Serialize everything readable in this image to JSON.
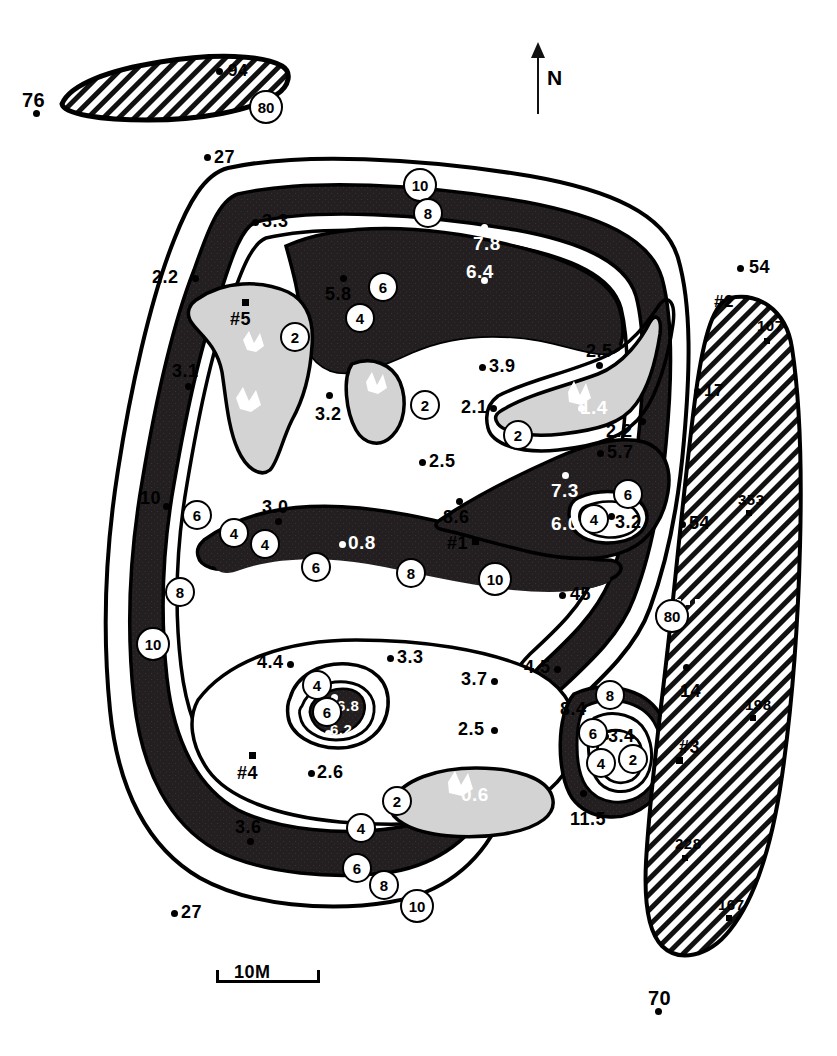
{
  "figure": {
    "type": "contour-map",
    "north_label": "N",
    "scale_label": "10M",
    "background": "#ffffff",
    "ink": "#000000",
    "fill_dark": "#231f20",
    "fill_gray": "#d3d3d3"
  },
  "legend_note": {
    "contour_interval_labels": [
      "2",
      "4",
      "6",
      "8",
      "10",
      "80"
    ]
  },
  "contour_tags": [
    {
      "id": "tag-top-10",
      "label": "10",
      "x": 403,
      "y": 168
    },
    {
      "id": "tag-top-8",
      "label": "8",
      "x": 413,
      "y": 198
    },
    {
      "id": "tag-upper-6",
      "label": "6",
      "x": 368,
      "y": 272
    },
    {
      "id": "tag-upper-4",
      "label": "4",
      "x": 345,
      "y": 303
    },
    {
      "id": "tag-left-2",
      "label": "2",
      "x": 280,
      "y": 322
    },
    {
      "id": "tag-mid-2a",
      "label": "2",
      "x": 410,
      "y": 390
    },
    {
      "id": "tag-mid-2b",
      "label": "2",
      "x": 503,
      "y": 420
    },
    {
      "id": "tag-left-6",
      "label": "6",
      "x": 182,
      "y": 500
    },
    {
      "id": "tag-left-4",
      "label": "4",
      "x": 219,
      "y": 518
    },
    {
      "id": "tag-left-8",
      "label": "8",
      "x": 165,
      "y": 577
    },
    {
      "id": "tag-left-10",
      "label": "10",
      "x": 136,
      "y": 627
    },
    {
      "id": "tag-center-4",
      "label": "4",
      "x": 250,
      "y": 529
    },
    {
      "id": "tag-center-6",
      "label": "6",
      "x": 301,
      "y": 552
    },
    {
      "id": "tag-center-8",
      "label": "8",
      "x": 396,
      "y": 558
    },
    {
      "id": "tag-center-10",
      "label": "10",
      "x": 478,
      "y": 562
    },
    {
      "id": "tag-right-6",
      "label": "6",
      "x": 613,
      "y": 479
    },
    {
      "id": "tag-right-4",
      "label": "4",
      "x": 579,
      "y": 504
    },
    {
      "id": "tag-right-80",
      "label": "80",
      "x": 655,
      "y": 599
    },
    {
      "id": "tag-low-4",
      "label": "4",
      "x": 302,
      "y": 670
    },
    {
      "id": "tag-low-6",
      "label": "6",
      "x": 312,
      "y": 697
    },
    {
      "id": "tag-low-2",
      "label": "2",
      "x": 382,
      "y": 786
    },
    {
      "id": "tag-bottom-4",
      "label": "4",
      "x": 346,
      "y": 813
    },
    {
      "id": "tag-bottom-6",
      "label": "6",
      "x": 342,
      "y": 853
    },
    {
      "id": "tag-bottom-8",
      "label": "8",
      "x": 369,
      "y": 870
    },
    {
      "id": "tag-bottom-10",
      "label": "10",
      "x": 400,
      "y": 889
    },
    {
      "id": "tag-se-8",
      "label": "8",
      "x": 595,
      "y": 680
    },
    {
      "id": "tag-se-6",
      "label": "6",
      "x": 578,
      "y": 718
    },
    {
      "id": "tag-se-4",
      "label": "4",
      "x": 586,
      "y": 748
    },
    {
      "id": "tag-se-2",
      "label": "2",
      "x": 618,
      "y": 744
    },
    {
      "id": "tag-inset-80",
      "label": "80",
      "x": 249,
      "y": 90
    }
  ],
  "stations": [
    {
      "id": "st-76",
      "label": "76",
      "lx": 22,
      "ly": 90,
      "dx": 33,
      "dy": 110,
      "size": "s20",
      "color": "black"
    },
    {
      "id": "st-94",
      "label": "94",
      "lx": 228,
      "ly": 62,
      "dx": 216,
      "dy": 68,
      "size": "s17",
      "color": "black"
    },
    {
      "id": "st-27a",
      "label": "27",
      "lx": 214,
      "ly": 148,
      "dx": 204,
      "dy": 154,
      "size": "s18",
      "color": "black"
    },
    {
      "id": "st-3p3",
      "label": "3.3",
      "lx": 262,
      "ly": 212,
      "dx": 252,
      "dy": 219,
      "size": "s18",
      "color": "black"
    },
    {
      "id": "st-2p2a",
      "label": "2.2",
      "lx": 152,
      "ly": 268,
      "dx": 192,
      "dy": 275,
      "size": "s18",
      "color": "black"
    },
    {
      "id": "st-5p5",
      "label": "#5",
      "lx": 230,
      "ly": 310,
      "dx": 242,
      "dy": 299,
      "size": "s18",
      "color": "black",
      "marker": "square"
    },
    {
      "id": "st-3p1",
      "label": "3.1",
      "lx": 172,
      "ly": 362,
      "dx": 185,
      "dy": 383,
      "size": "s18",
      "color": "black"
    },
    {
      "id": "st-3p2a",
      "label": "3.2",
      "lx": 315,
      "ly": 405,
      "dx": 326,
      "dy": 392,
      "size": "s18",
      "color": "black"
    },
    {
      "id": "st-5p8",
      "label": "5.8",
      "lx": 325,
      "ly": 285,
      "dx": 340,
      "dy": 275,
      "size": "s18",
      "color": "black"
    },
    {
      "id": "st-7p8",
      "label": "7.8",
      "lx": 473,
      "ly": 234,
      "dx": 481,
      "dy": 224,
      "size": "s19",
      "color": "white"
    },
    {
      "id": "st-6p4",
      "label": "6.4",
      "lx": 466,
      "ly": 262,
      "dx": 481,
      "dy": 277,
      "size": "s19",
      "color": "white"
    },
    {
      "id": "st-3p9",
      "label": "3.9",
      "lx": 489,
      "ly": 357,
      "dx": 479,
      "dy": 364,
      "size": "s18",
      "color": "black"
    },
    {
      "id": "st-2p5a",
      "label": "2.5",
      "lx": 586,
      "ly": 342,
      "dx": 596,
      "dy": 362,
      "size": "s18",
      "color": "black"
    },
    {
      "id": "st-2p1",
      "label": "2.1",
      "lx": 461,
      "ly": 398,
      "dx": 490,
      "dy": 405,
      "size": "s18",
      "color": "black"
    },
    {
      "id": "st-1p4",
      "label": "1.4",
      "lx": 580,
      "ly": 398,
      "dx": 578,
      "dy": 405,
      "size": "s19",
      "color": "white"
    },
    {
      "id": "st-2p2b",
      "label": "2.2",
      "lx": 606,
      "ly": 422,
      "dx": 639,
      "dy": 418,
      "size": "s18",
      "color": "black"
    },
    {
      "id": "st-2p5b",
      "label": "2.5",
      "lx": 429,
      "ly": 452,
      "dx": 419,
      "dy": 459,
      "size": "s18",
      "color": "black"
    },
    {
      "id": "st-5p7",
      "label": "5.7",
      "lx": 607,
      "ly": 443,
      "dx": 597,
      "dy": 450,
      "size": "s18",
      "color": "black"
    },
    {
      "id": "st-3p0",
      "label": "3.0",
      "lx": 262,
      "ly": 498,
      "dx": 275,
      "dy": 518,
      "size": "s18",
      "color": "black"
    },
    {
      "id": "st-0p8",
      "label": "0.8",
      "lx": 348,
      "ly": 533,
      "dx": 339,
      "dy": 541,
      "size": "s19",
      "color": "white"
    },
    {
      "id": "st-8p6",
      "label": "8.6",
      "lx": 443,
      "ly": 508,
      "dx": 456,
      "dy": 498,
      "size": "s18",
      "color": "black"
    },
    {
      "id": "st-1sq",
      "label": "#1",
      "lx": 447,
      "ly": 534,
      "dx": 472,
      "dy": 538,
      "size": "s18",
      "color": "black",
      "marker": "square"
    },
    {
      "id": "st-7p3",
      "label": "7.3",
      "lx": 551,
      "ly": 481,
      "dx": 562,
      "dy": 472,
      "size": "s19",
      "color": "white"
    },
    {
      "id": "st-6p0",
      "label": "6.0",
      "lx": 551,
      "ly": 514,
      "dx": 578,
      "dy": 521,
      "size": "s19",
      "color": "white"
    },
    {
      "id": "st-3p2b",
      "label": "3.2",
      "lx": 615,
      "ly": 513,
      "dx": 608,
      "dy": 513,
      "size": "s18",
      "color": "black"
    },
    {
      "id": "st-54a",
      "label": "54",
      "lx": 749,
      "ly": 258,
      "dx": 737,
      "dy": 265,
      "size": "s18",
      "color": "black"
    },
    {
      "id": "st-2sq",
      "label": "#2",
      "lx": 714,
      "ly": 293,
      "dx": 0,
      "dy": 0,
      "size": "s17",
      "color": "black",
      "marker": "none"
    },
    {
      "id": "st-107",
      "label": "107",
      "lx": 757,
      "ly": 318,
      "dx": 764,
      "dy": 338,
      "size": "s15",
      "color": "black",
      "marker": "smallsq"
    },
    {
      "id": "st-17",
      "label": "17",
      "lx": 704,
      "ly": 382,
      "dx": 694,
      "dy": 388,
      "size": "s17",
      "color": "black"
    },
    {
      "id": "st-353",
      "label": "353",
      "lx": 738,
      "ly": 492,
      "dx": 746,
      "dy": 510,
      "size": "s15",
      "color": "black",
      "marker": "smallsq"
    },
    {
      "id": "st-54b",
      "label": "54",
      "lx": 689,
      "ly": 514,
      "dx": 679,
      "dy": 521,
      "size": "s18",
      "color": "black"
    },
    {
      "id": "st-45",
      "label": "45",
      "lx": 570,
      "ly": 585,
      "dx": 559,
      "dy": 592,
      "size": "s18",
      "color": "black"
    },
    {
      "id": "st-10L",
      "label": "10",
      "lx": 140,
      "ly": 489,
      "dx": 163,
      "dy": 503,
      "size": "s18",
      "color": "black"
    },
    {
      "id": "st-4p4",
      "label": "4.4",
      "lx": 257,
      "ly": 653,
      "dx": 287,
      "dy": 661,
      "size": "s18",
      "color": "black"
    },
    {
      "id": "st-3p3b",
      "label": "3.3",
      "lx": 397,
      "ly": 648,
      "dx": 387,
      "dy": 655,
      "size": "s18",
      "color": "black"
    },
    {
      "id": "st-3p7",
      "label": "3.7",
      "lx": 461,
      "ly": 670,
      "dx": 491,
      "dy": 678,
      "size": "s18",
      "color": "black"
    },
    {
      "id": "st-4p5",
      "label": "4.5",
      "lx": 524,
      "ly": 658,
      "dx": 554,
      "dy": 666,
      "size": "s18",
      "color": "black"
    },
    {
      "id": "st-6p8",
      "label": "6.8",
      "lx": 337,
      "ly": 698,
      "dx": 331,
      "dy": 694,
      "size": "s15",
      "color": "white"
    },
    {
      "id": "st-6p2",
      "label": "6.2",
      "lx": 330,
      "ly": 722,
      "dx": 325,
      "dy": 730,
      "size": "s15",
      "color": "white"
    },
    {
      "id": "st-2p5c",
      "label": "2.5",
      "lx": 458,
      "ly": 720,
      "dx": 491,
      "dy": 727,
      "size": "s18",
      "color": "black"
    },
    {
      "id": "st-4sq",
      "label": "#4",
      "lx": 237,
      "ly": 764,
      "dx": 249,
      "dy": 752,
      "size": "s18",
      "color": "black",
      "marker": "square"
    },
    {
      "id": "st-2p6",
      "label": "2.6",
      "lx": 317,
      "ly": 763,
      "dx": 308,
      "dy": 770,
      "size": "s18",
      "color": "black"
    },
    {
      "id": "st-3p6",
      "label": "3.6",
      "lx": 235,
      "ly": 818,
      "dx": 247,
      "dy": 838,
      "size": "s18",
      "color": "black"
    },
    {
      "id": "st-0p6",
      "label": "0.6",
      "lx": 461,
      "ly": 785,
      "dx": 0,
      "dy": 0,
      "size": "s19",
      "color": "white",
      "marker": "none"
    },
    {
      "id": "st-8p4",
      "label": "8.4",
      "lx": 560,
      "ly": 700,
      "dx": 0,
      "dy": 0,
      "size": "s18",
      "color": "black",
      "marker": "none"
    },
    {
      "id": "st-3p4",
      "label": "3.4",
      "lx": 608,
      "ly": 727,
      "dx": 602,
      "dy": 733,
      "size": "s18",
      "color": "black"
    },
    {
      "id": "st-11p5",
      "label": "11.5",
      "lx": 570,
      "ly": 810,
      "dx": 580,
      "dy": 790,
      "size": "s18",
      "color": "black"
    },
    {
      "id": "st-14",
      "label": "14",
      "lx": 680,
      "ly": 682,
      "dx": 683,
      "dy": 664,
      "size": "s18",
      "color": "black"
    },
    {
      "id": "st-198",
      "label": "198",
      "lx": 745,
      "ly": 697,
      "dx": 750,
      "dy": 715,
      "size": "s15",
      "color": "black",
      "marker": "smallsq"
    },
    {
      "id": "st-3sq",
      "label": "#3",
      "lx": 679,
      "ly": 738,
      "dx": 676,
      "dy": 757,
      "size": "s18",
      "color": "black",
      "marker": "square"
    },
    {
      "id": "st-228",
      "label": "228",
      "lx": 675,
      "ly": 836,
      "dx": 682,
      "dy": 855,
      "size": "s15",
      "color": "black",
      "marker": "smallsq"
    },
    {
      "id": "st-167",
      "label": "167",
      "lx": 718,
      "ly": 897,
      "dx": 726,
      "dy": 915,
      "size": "s15",
      "color": "black",
      "marker": "smallsq"
    },
    {
      "id": "st-70",
      "label": "70",
      "lx": 648,
      "ly": 988,
      "dx": 655,
      "dy": 1008,
      "size": "s20",
      "color": "black"
    },
    {
      "id": "st-27b",
      "label": "27",
      "lx": 181,
      "ly": 903,
      "dx": 171,
      "dy": 910,
      "size": "s18",
      "color": "black"
    }
  ]
}
